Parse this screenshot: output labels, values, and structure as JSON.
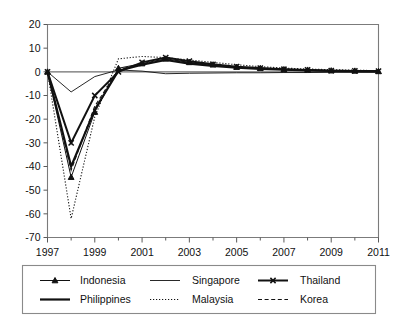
{
  "chart_data": {
    "type": "line",
    "title": "",
    "subtitle": "",
    "xlabel": "",
    "ylabel": "",
    "xlim": [
      1997,
      2011
    ],
    "ylim": [
      -70,
      20
    ],
    "ytick_labels": [
      "20",
      "10",
      "0",
      "-10",
      "-20",
      "-30",
      "-40",
      "-50",
      "-60",
      "-70"
    ],
    "ytick_values": [
      20,
      10,
      0,
      -10,
      -20,
      -30,
      -40,
      -50,
      -60,
      -70
    ],
    "xtick_labels": [
      "1997",
      "1999",
      "2001",
      "2003",
      "2005",
      "2007",
      "2009",
      "2011"
    ],
    "xtick_values": [
      1997,
      1999,
      2001,
      2003,
      2005,
      2007,
      2009,
      2011
    ],
    "x_minor_ticks": [
      1998,
      2000,
      2002,
      2004,
      2006,
      2008,
      2010
    ],
    "grid": false,
    "legend_position": "bottom",
    "x": [
      1997,
      1998,
      1999,
      2000,
      2001,
      2002,
      2003,
      2004,
      2005,
      2006,
      2007,
      2008,
      2009,
      2010,
      2011
    ],
    "series": [
      {
        "name": "Indonesia",
        "style": "solid-thin-marker",
        "marker": "triangle",
        "values": [
          0,
          -44.5,
          -17.0,
          1.5,
          3.5,
          5.5,
          4.0,
          3.0,
          2.0,
          1.5,
          1.0,
          0.8,
          0.5,
          0.4,
          0.2
        ]
      },
      {
        "name": "Philippines",
        "style": "solid-thick",
        "marker": "none",
        "values": [
          0,
          -40.0,
          -16.0,
          0.5,
          3.0,
          5.0,
          3.5,
          2.5,
          1.8,
          1.2,
          0.9,
          0.6,
          0.4,
          0.3,
          0.2
        ]
      },
      {
        "name": "Singapore",
        "style": "solid-thin",
        "marker": "none",
        "values": [
          0,
          -8.5,
          -2.0,
          0.8,
          0.3,
          -0.8,
          -0.6,
          -0.5,
          -0.4,
          -0.4,
          -0.3,
          -0.3,
          -0.2,
          -0.2,
          -0.2
        ]
      },
      {
        "name": "Malaysia",
        "style": "dotted",
        "marker": "none",
        "values": [
          0,
          -62.0,
          -19.0,
          5.5,
          6.5,
          6.0,
          5.0,
          4.0,
          3.0,
          2.2,
          1.6,
          1.2,
          0.9,
          0.7,
          0.5
        ]
      },
      {
        "name": "Thailand",
        "style": "solid-thick-marker",
        "marker": "x",
        "values": [
          0,
          -30.0,
          -10.0,
          0.0,
          4.0,
          6.0,
          4.5,
          3.2,
          2.2,
          1.6,
          1.1,
          0.8,
          0.5,
          0.4,
          0.3
        ]
      },
      {
        "name": "Korea",
        "style": "dashed",
        "marker": "none",
        "values": [
          0,
          -41.5,
          -14.5,
          1.0,
          3.2,
          5.2,
          3.8,
          2.8,
          2.0,
          1.4,
          1.0,
          0.7,
          0.5,
          0.3,
          0.2
        ]
      }
    ]
  },
  "legend": {
    "entries": [
      {
        "label": "Indonesia"
      },
      {
        "label": "Philippines"
      },
      {
        "label": "Singapore"
      },
      {
        "label": "Malaysia"
      },
      {
        "label": "Thailand"
      },
      {
        "label": "Korea"
      }
    ]
  },
  "colors": {
    "line": "#111111",
    "axis": "#7b7b7b",
    "background": "#ffffff"
  }
}
